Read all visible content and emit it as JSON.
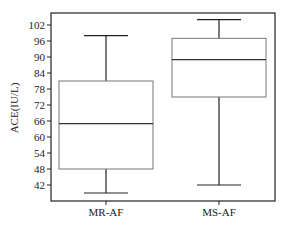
{
  "chart_data": {
    "type": "box",
    "title": "",
    "xlabel": "",
    "ylabel": "ACE(IU/L)",
    "categories": [
      "MR-AF",
      "MS-AF"
    ],
    "yticks": [
      42,
      48,
      54,
      60,
      66,
      72,
      78,
      84,
      90,
      96,
      102
    ],
    "ylim": [
      37.5,
      106.5
    ],
    "grid": false,
    "series": [
      {
        "name": "MR-AF",
        "whisker_low": 39,
        "q1": 48,
        "median": 65,
        "q3": 81,
        "whisker_high": 98
      },
      {
        "name": "MS-AF",
        "whisker_low": 42,
        "q1": 75,
        "median": 89,
        "q3": 97,
        "whisker_high": 104
      }
    ]
  },
  "colors": {
    "axis": "#222222",
    "box_stroke": "#777777",
    "whisker": "#222222",
    "median": "#333333"
  }
}
